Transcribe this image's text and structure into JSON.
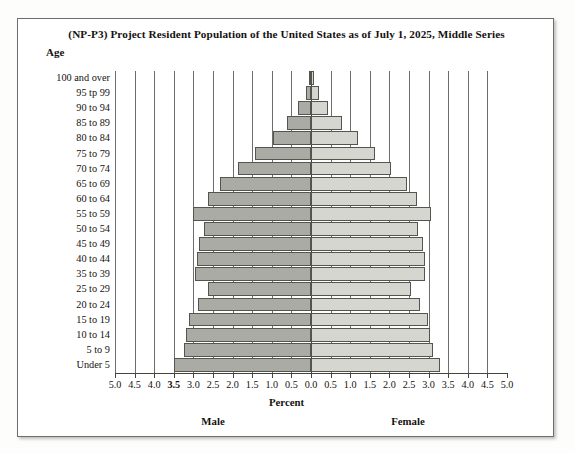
{
  "chart_data": {
    "type": "bar",
    "subtype": "population-pyramid",
    "title": "(NP-P3) Project Resident Population of the United States as of July 1, 2025, Middle Series",
    "xlabel": "Percent",
    "ylabel": "Age",
    "xlim": [
      -5.0,
      5.0
    ],
    "grid": true,
    "legend_position": "below-axis",
    "axis_ticks": [
      "5.0",
      "4.5",
      "4.0",
      "3.5",
      "3.0",
      "2.5",
      "2.0",
      "1.5",
      "1.0",
      "0.5",
      "0.0",
      "0.5",
      "1.0",
      "1.5",
      "2.0",
      "2.5",
      "3.0",
      "3.5",
      "4.0",
      "4.5",
      "5.0"
    ],
    "emphasized_tick": "3.5",
    "tick_step": 0.5,
    "categories": [
      "100 and over",
      "95 tp 99",
      "90 to 94",
      "85 to 89",
      "80 to 84",
      "75 to 79",
      "70 to 74",
      "65 to 69",
      "60 to 64",
      "55 to 59",
      "50 to 54",
      "45 to 49",
      "40 to 44",
      "35 to 39",
      "25 to 29",
      "20 to 24",
      "15 to 19",
      "10 to 14",
      "5 to 9",
      "Under 5"
    ],
    "series": [
      {
        "name": "Male",
        "color": "#ababa6",
        "side": "left",
        "values": [
          0.04,
          0.13,
          0.32,
          0.62,
          0.98,
          1.42,
          1.86,
          2.32,
          2.62,
          3.02,
          2.72,
          2.86,
          2.92,
          2.96,
          2.64,
          2.88,
          3.12,
          3.18,
          3.24,
          3.5
        ]
      },
      {
        "name": "Female",
        "color": "#d6d6d1",
        "side": "right",
        "values": [
          0.07,
          0.2,
          0.44,
          0.8,
          1.2,
          1.64,
          2.04,
          2.44,
          2.7,
          3.06,
          2.74,
          2.86,
          2.9,
          2.92,
          2.56,
          2.78,
          2.98,
          3.04,
          3.1,
          3.3
        ]
      }
    ]
  },
  "footer": {
    "percent": "Percent",
    "male": "Male",
    "female": "Female"
  },
  "header": {
    "age_caption": "Age"
  }
}
